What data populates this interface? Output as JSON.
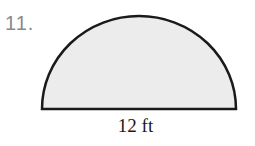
{
  "problem": {
    "number": "11."
  },
  "figure": {
    "shape": "semicircle",
    "fill_color": "#ececec",
    "stroke_color": "#1a1a1a",
    "diameter_label": "12 ft"
  }
}
